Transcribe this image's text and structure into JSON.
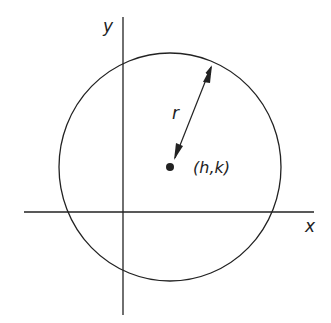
{
  "diagram": {
    "labels": {
      "y_axis": "y",
      "x_axis": "x",
      "radius": "r",
      "center": "(h,k)"
    },
    "colors": {
      "stroke": "#222222",
      "background": "#ffffff"
    }
  }
}
